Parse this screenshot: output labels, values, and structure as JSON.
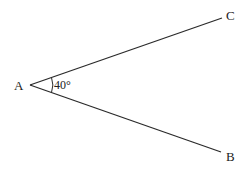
{
  "diagram": {
    "title": "",
    "vertex": {
      "label": "A",
      "x": 30,
      "y": 85
    },
    "rays": [
      {
        "label": "C",
        "end_x": 222,
        "end_y": 18
      },
      {
        "label": "B",
        "end_x": 221,
        "end_y": 152
      }
    ],
    "angle": {
      "label": "40°",
      "value_deg": 40
    },
    "line_color": "#2a2a2a"
  }
}
